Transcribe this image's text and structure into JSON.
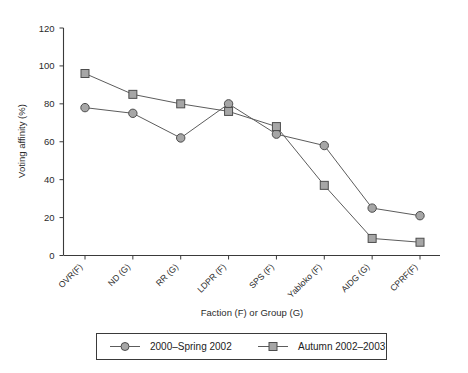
{
  "chart_data": {
    "type": "line",
    "title": "",
    "subtitle": "",
    "xlabel": "Faction (F) or Group (G)",
    "ylabel": "Voting affinity (%)",
    "categories": [
      "OVR(F)",
      "ND (G)",
      "RR (G)",
      "LDPR (F)",
      "SPS (F)",
      "Yabloko (F)",
      "AIDG (G)",
      "CPRF(F)"
    ],
    "ylim": [
      0,
      120
    ],
    "yticks": [
      0,
      20,
      40,
      60,
      80,
      100,
      120
    ],
    "ytick_labels": [
      "0",
      "20",
      "40",
      "60",
      "80",
      "100",
      "120"
    ],
    "grid": false,
    "legend_position": "bottom",
    "series": [
      {
        "name": "2000–Spring 2002",
        "marker": "circle",
        "values": [
          78,
          75,
          62,
          80,
          64,
          58,
          25,
          21
        ]
      },
      {
        "name": "Autumn 2002–2003",
        "marker": "square",
        "values": [
          96,
          85,
          80,
          76,
          68,
          37,
          9,
          7
        ]
      }
    ]
  },
  "legend": {
    "items": [
      {
        "label": "2000–Spring 2002",
        "marker": "circle"
      },
      {
        "label": "Autumn 2002–2003",
        "marker": "square"
      }
    ]
  },
  "colors": {
    "marker_fill": "#a6a6a6",
    "marker_stroke": "#4d4d4d",
    "line": "#5c5c5c",
    "axis": "#3a3a3a",
    "text": "#2b2b2b",
    "background": "#ffffff"
  }
}
